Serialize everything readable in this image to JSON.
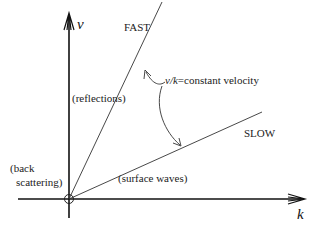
{
  "diagram": {
    "axes": {
      "vertical_label": "ν",
      "horizontal_label": "k"
    },
    "lines": [
      {
        "name": "fast",
        "label": "FAST"
      },
      {
        "name": "slow",
        "label": "SLOW"
      }
    ],
    "annotations": {
      "velocity_prefix": "ν/",
      "velocity_k": "k",
      "velocity_suffix": "=constant velocity",
      "reflections": "(reflections)",
      "surface_waves": "(surface waves)",
      "back_line1": "(back",
      "back_line2": "scattering)"
    },
    "colors": {
      "ink": "#222222",
      "axis": "#111111"
    }
  }
}
